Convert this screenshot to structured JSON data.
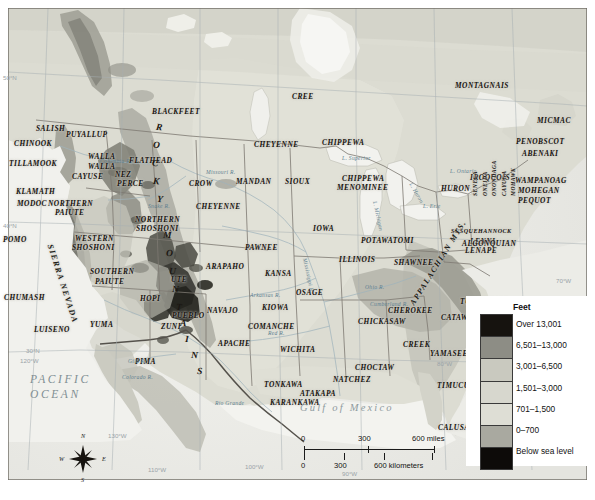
{
  "map": {
    "title": "Native American Tribes and Elevation Map of North America",
    "oceans": [
      {
        "name": "PACIFIC OCEAN",
        "line1": "PACIFIC",
        "line2": "OCEAN",
        "x": 30,
        "y": 372
      },
      {
        "name": "ATLANTIC OCEAN",
        "line1": "ATLANTIC",
        "line2": "OCEAN",
        "x": 505,
        "y": 302
      }
    ],
    "gulf_label": "Gulf of Mexico",
    "mountain_ranges": [
      {
        "label": "ROCKY MOUNTAINS",
        "letters": [
          "R",
          "O",
          "C",
          "K",
          "Y",
          " ",
          "M",
          "O",
          "U",
          "N",
          "T",
          "A",
          "I",
          "N",
          "S"
        ]
      },
      {
        "label": "SIERRA NEVADA"
      },
      {
        "label": "APPALACHIAN MTS."
      }
    ],
    "water_features": [
      {
        "label": "L. Superior",
        "x": 342,
        "y": 155
      },
      {
        "label": "L. Michigan",
        "x": 375,
        "y": 198
      },
      {
        "label": "L. Huron",
        "x": 411,
        "y": 180
      },
      {
        "label": "L. Ontario",
        "x": 450,
        "y": 168
      },
      {
        "label": "L. Erie",
        "x": 423,
        "y": 203
      },
      {
        "label": "Ohio R.",
        "x": 365,
        "y": 284
      },
      {
        "label": "Cumberland R.",
        "x": 370,
        "y": 301
      },
      {
        "label": "Missouri R.",
        "x": 206,
        "y": 169
      },
      {
        "label": "Mississippi R.",
        "x": 305,
        "y": 255
      },
      {
        "label": "Arkansas R.",
        "x": 250,
        "y": 292
      },
      {
        "label": "Rio Grande",
        "x": 215,
        "y": 400
      },
      {
        "label": "Colorado R.",
        "x": 122,
        "y": 374
      },
      {
        "label": "Snake R.",
        "x": 148,
        "y": 203
      },
      {
        "label": "Columbia R.",
        "x": 100,
        "y": 158
      },
      {
        "label": "Gila R.",
        "x": 128,
        "y": 358
      },
      {
        "label": "Red R.",
        "x": 268,
        "y": 330
      }
    ],
    "tribes": [
      {
        "name": "MONTAGNAIS",
        "x": 455,
        "y": 81,
        "size": "md"
      },
      {
        "name": "CREE",
        "x": 292,
        "y": 92,
        "size": "md"
      },
      {
        "name": "BLACKFEET",
        "x": 152,
        "y": 107,
        "size": "md"
      },
      {
        "name": "MICMAC",
        "x": 537,
        "y": 116,
        "size": "md"
      },
      {
        "name": "SALISH",
        "x": 36,
        "y": 124,
        "size": "md"
      },
      {
        "name": "PUYALLUP",
        "x": 66,
        "y": 130,
        "size": "md"
      },
      {
        "name": "PENOBSCOT",
        "x": 516,
        "y": 137,
        "size": "md"
      },
      {
        "name": "CHINOOK",
        "x": 14,
        "y": 139,
        "size": "md"
      },
      {
        "name": "CHEYENNE",
        "x": 254,
        "y": 140,
        "size": "md"
      },
      {
        "name": "CHIPPEWA",
        "x": 322,
        "y": 138,
        "size": "md"
      },
      {
        "name": "ABENAKI",
        "x": 522,
        "y": 149,
        "size": "md"
      },
      {
        "name": "TILLAMOOK",
        "x": 9,
        "y": 159,
        "size": "md"
      },
      {
        "name": "WALLA",
        "x": 88,
        "y": 152,
        "size": "md"
      },
      {
        "name": "WALLA",
        "x": 88,
        "y": 162,
        "size": "md"
      },
      {
        "name": "FLATHEAD",
        "x": 129,
        "y": 156,
        "size": "md"
      },
      {
        "name": "CAYUSE",
        "x": 72,
        "y": 172,
        "size": "md"
      },
      {
        "name": "NEZ",
        "x": 115,
        "y": 170,
        "size": "md"
      },
      {
        "name": "PERCE",
        "x": 117,
        "y": 179,
        "size": "md"
      },
      {
        "name": "CROW",
        "x": 189,
        "y": 179,
        "size": "md"
      },
      {
        "name": "MANDAN",
        "x": 236,
        "y": 177,
        "size": "md"
      },
      {
        "name": "SIOUX",
        "x": 285,
        "y": 177,
        "size": "md"
      },
      {
        "name": "CHIPPEWA",
        "x": 342,
        "y": 174,
        "size": "md"
      },
      {
        "name": "HURON",
        "x": 441,
        "y": 184,
        "size": "md"
      },
      {
        "name": "IROQUOIS",
        "x": 470,
        "y": 173,
        "size": "md"
      },
      {
        "name": "WAMPANOAG",
        "x": 515,
        "y": 176,
        "size": "md"
      },
      {
        "name": "MENOMINEE",
        "x": 337,
        "y": 183,
        "size": "md"
      },
      {
        "name": "MOHEGAN",
        "x": 518,
        "y": 186,
        "size": "md"
      },
      {
        "name": "KLAMATH",
        "x": 16,
        "y": 187,
        "size": "md"
      },
      {
        "name": "PEQUOT",
        "x": 518,
        "y": 196,
        "size": "md"
      },
      {
        "name": "MODOC",
        "x": 17,
        "y": 199,
        "size": "md"
      },
      {
        "name": "NORTHERN",
        "x": 48,
        "y": 199,
        "size": "md"
      },
      {
        "name": "CHEYENNE",
        "x": 196,
        "y": 202,
        "size": "md"
      },
      {
        "name": "PAIUTE",
        "x": 55,
        "y": 208,
        "size": "md"
      },
      {
        "name": "NORTHERN",
        "x": 135,
        "y": 215,
        "size": "md"
      },
      {
        "name": "SHOSHONI",
        "x": 136,
        "y": 224,
        "size": "md"
      },
      {
        "name": "IOWA",
        "x": 313,
        "y": 224,
        "size": "md"
      },
      {
        "name": "POMO",
        "x": 3,
        "y": 235,
        "size": "md"
      },
      {
        "name": "WESTERN",
        "x": 75,
        "y": 234,
        "size": "md"
      },
      {
        "name": "SHOSHONI",
        "x": 72,
        "y": 243,
        "size": "md"
      },
      {
        "name": "PAWNEE",
        "x": 245,
        "y": 243,
        "size": "md"
      },
      {
        "name": "POTAWATOMI",
        "x": 361,
        "y": 236,
        "size": "md"
      },
      {
        "name": "LENNI",
        "x": 470,
        "y": 237,
        "size": "md"
      },
      {
        "name": "SUSQUEHANNOCK",
        "x": 451,
        "y": 228,
        "size": "xs"
      },
      {
        "name": "LENAPE",
        "x": 465,
        "y": 246,
        "size": "md"
      },
      {
        "name": "ALGONQUIAN",
        "x": 462,
        "y": 239,
        "size": "md"
      },
      {
        "name": "SOUTHERN",
        "x": 90,
        "y": 267,
        "size": "md"
      },
      {
        "name": "ARAPAHO",
        "x": 206,
        "y": 262,
        "size": "md"
      },
      {
        "name": "KANSA",
        "x": 265,
        "y": 269,
        "size": "md"
      },
      {
        "name": "ILLINOIS",
        "x": 339,
        "y": 255,
        "size": "md"
      },
      {
        "name": "SHAWNEE",
        "x": 394,
        "y": 258,
        "size": "md"
      },
      {
        "name": "PAIUTE",
        "x": 95,
        "y": 277,
        "size": "md"
      },
      {
        "name": "CHUMASH",
        "x": 4,
        "y": 293,
        "size": "md"
      },
      {
        "name": "UTE",
        "x": 171,
        "y": 275,
        "size": "md"
      },
      {
        "name": "HOPI",
        "x": 140,
        "y": 294,
        "size": "md"
      },
      {
        "name": "NAVAJO",
        "x": 207,
        "y": 306,
        "size": "md"
      },
      {
        "name": "OSAGE",
        "x": 296,
        "y": 288,
        "size": "md"
      },
      {
        "name": "KIOWA",
        "x": 262,
        "y": 303,
        "size": "md"
      },
      {
        "name": "CHEROKEE",
        "x": 388,
        "y": 306,
        "size": "md"
      },
      {
        "name": "TUSCARORA",
        "x": 460,
        "y": 297,
        "size": "md"
      },
      {
        "name": "PUEBLO",
        "x": 172,
        "y": 311,
        "size": "md"
      },
      {
        "name": "COMANCHE",
        "x": 248,
        "y": 322,
        "size": "md"
      },
      {
        "name": "CHICKASAW",
        "x": 358,
        "y": 317,
        "size": "md"
      },
      {
        "name": "CATAWBA",
        "x": 441,
        "y": 313,
        "size": "md"
      },
      {
        "name": "ZUNI",
        "x": 161,
        "y": 322,
        "size": "md"
      },
      {
        "name": "LUISENO",
        "x": 34,
        "y": 325,
        "size": "md"
      },
      {
        "name": "YUMA",
        "x": 90,
        "y": 320,
        "size": "md"
      },
      {
        "name": "APACHE",
        "x": 218,
        "y": 339,
        "size": "md"
      },
      {
        "name": "CREEK",
        "x": 403,
        "y": 340,
        "size": "md"
      },
      {
        "name": "WICHITA",
        "x": 280,
        "y": 345,
        "size": "md"
      },
      {
        "name": "YAMASEE",
        "x": 430,
        "y": 349,
        "size": "md"
      },
      {
        "name": "PIMA",
        "x": 135,
        "y": 357,
        "size": "md"
      },
      {
        "name": "CHOCTAW",
        "x": 355,
        "y": 363,
        "size": "md"
      },
      {
        "name": "TONKAWA",
        "x": 264,
        "y": 380,
        "size": "md"
      },
      {
        "name": "NATCHEZ",
        "x": 333,
        "y": 375,
        "size": "md"
      },
      {
        "name": "ATAKAPA",
        "x": 300,
        "y": 389,
        "size": "md"
      },
      {
        "name": "TIMUCUA",
        "x": 437,
        "y": 381,
        "size": "md"
      },
      {
        "name": "KARANKAWA",
        "x": 270,
        "y": 398,
        "size": "md"
      },
      {
        "name": "CALUSA",
        "x": 438,
        "y": 423,
        "size": "md"
      }
    ],
    "iroquois_nations": [
      "SENECA",
      "ONEIDA",
      "ONONDAGA",
      "CAYUGA",
      "MOHAWK"
    ],
    "graticule": [
      {
        "label": "50°N",
        "x": 3,
        "y": 74
      },
      {
        "label": "40°N",
        "x": 3,
        "y": 222
      },
      {
        "label": "30°N",
        "x": 26,
        "y": 347
      },
      {
        "label": "120°W",
        "x": 20,
        "y": 357
      },
      {
        "label": "130°W",
        "x": 108,
        "y": 432
      },
      {
        "label": "110°W",
        "x": 148,
        "y": 466
      },
      {
        "label": "100°W",
        "x": 245,
        "y": 463
      },
      {
        "label": "90°W",
        "x": 342,
        "y": 470
      },
      {
        "label": "80°W",
        "x": 437,
        "y": 360
      },
      {
        "label": "70°W",
        "x": 556,
        "y": 277
      }
    ]
  },
  "legend": {
    "title": "Feet",
    "entries": [
      {
        "label": "Over 13,001",
        "color": "#16130f"
      },
      {
        "label": "6,501–13,000",
        "color": "#8d8d85"
      },
      {
        "label": "3,001–6,500",
        "color": "#c9c9bf"
      },
      {
        "label": "1,501–3,000",
        "color": "#d7d7ce"
      },
      {
        "label": "701–1,500",
        "color": "#dedeD5"
      },
      {
        "label": "0–700",
        "color": "#a9a9a0"
      },
      {
        "label": "Below sea level",
        "color": "#0d0b09"
      }
    ]
  },
  "scalebar": {
    "miles_ticks": [
      "0",
      "300",
      "600 miles"
    ],
    "km_ticks": [
      "0",
      "300",
      "600 kilometers"
    ]
  },
  "compass": {
    "north": "N",
    "south": "S",
    "east": "E",
    "west": "W"
  }
}
